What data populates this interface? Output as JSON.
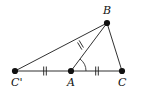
{
  "figure": {
    "width": 151,
    "height": 91,
    "background_color": "#ffffff",
    "stroke_color": "#1a1a1a",
    "dot_color": "#111111"
  },
  "points": [
    {
      "id": "Cprime",
      "label": "C'",
      "x": 15,
      "y": 71,
      "label_x": 11,
      "label_y": 86,
      "dot_r": 3.1
    },
    {
      "id": "A",
      "label": "A",
      "x": 71,
      "y": 71,
      "label_x": 67,
      "label_y": 86,
      "dot_r": 3.1
    },
    {
      "id": "C",
      "label": "C",
      "x": 122,
      "y": 71,
      "label_x": 118,
      "label_y": 86,
      "dot_r": 3.1
    },
    {
      "id": "B",
      "label": "B",
      "x": 107,
      "y": 23,
      "label_x": 103,
      "label_y": 14,
      "dot_r": 3.1
    }
  ],
  "segments": [
    {
      "id": "CprimeB",
      "from": "C'",
      "to": "B",
      "x1": 15,
      "y1": 71,
      "x2": 107,
      "y2": 23
    },
    {
      "id": "CprimeC",
      "from": "C'",
      "to": "C",
      "x1": 15,
      "y1": 71,
      "x2": 122,
      "y2": 71
    },
    {
      "id": "AB",
      "from": "A",
      "to": "B",
      "x1": 71,
      "y1": 71,
      "x2": 107,
      "y2": 23
    },
    {
      "id": "BC",
      "from": "B",
      "to": "C",
      "x1": 107,
      "y1": 23,
      "x2": 122,
      "y2": 71
    }
  ],
  "tick_marks": [
    {
      "id": "tick-CprimeA",
      "on_segment": "C'A",
      "count": 2,
      "style": "double-vertical",
      "center_x": 45,
      "center_y": 71,
      "half_len": 4.5,
      "spacing": 2.6,
      "angle_deg": 0
    },
    {
      "id": "tick-AC",
      "on_segment": "AC",
      "count": 2,
      "style": "double-vertical",
      "center_x": 97,
      "center_y": 71,
      "half_len": 4.5,
      "spacing": 2.6,
      "angle_deg": 0
    },
    {
      "id": "tick-AB",
      "on_segment": "AB",
      "count": 2,
      "style": "double-cross",
      "center_x": 80.5,
      "center_y": 45,
      "half_len": 4.2,
      "spacing": 2.6,
      "angle_deg": 53
    }
  ],
  "angle_arcs": [
    {
      "id": "angle-BAC",
      "vertex": "A",
      "from_ray": "AC",
      "to_ray": "AB",
      "cx": 71,
      "cy": 71,
      "radius": 15,
      "start_deg": 0,
      "end_deg": 53
    }
  ],
  "labels": {
    "b": "B",
    "a": "A",
    "c": "C",
    "c_prime": "C'"
  }
}
